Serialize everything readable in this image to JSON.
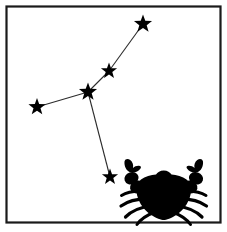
{
  "frame": {
    "name": "border-frame",
    "x": 6.5,
    "y": 6.5,
    "width": 214,
    "height": 216,
    "stroke_color": "#1a1a1a",
    "fill_color": "#ffffff"
  },
  "canvas": {
    "width": 227,
    "height": 232,
    "background": "#ffffff"
  },
  "constellation": {
    "name": "Cancer",
    "star_color": "#000000",
    "line_color": "#2b2b2b",
    "stars": [
      {
        "id": "star-top",
        "label": "Iota Cancri",
        "x": 143,
        "y": 24,
        "r": 9.5
      },
      {
        "id": "star-upper-mid",
        "label": "Delta Cancri",
        "x": 109,
        "y": 71,
        "r": 8.5
      },
      {
        "id": "star-junction",
        "label": "Beta Cancri",
        "x": 88,
        "y": 92,
        "r": 9.5
      },
      {
        "id": "star-left",
        "label": "Alpha Cancri",
        "x": 37,
        "y": 107,
        "r": 9.0
      },
      {
        "id": "star-bottom",
        "label": "Gamma Cancri",
        "x": 110,
        "y": 177,
        "r": 8.5
      }
    ],
    "segments": [
      {
        "id": "segment-top",
        "from": "star-top",
        "to": "star-upper-mid"
      },
      {
        "id": "segment-upper",
        "from": "star-upper-mid",
        "to": "star-junction"
      },
      {
        "id": "segment-left",
        "from": "star-junction",
        "to": "star-left"
      },
      {
        "id": "segment-down",
        "from": "star-junction",
        "to": "star-bottom"
      }
    ]
  },
  "crab": {
    "name": "crab-symbol",
    "color": "#000000",
    "shell_label": "crab-shell",
    "left_claw_label": "crab-left-claw",
    "right_claw_label": "crab-right-claw",
    "left_legs_label": "crab-left-legs",
    "right_legs_label": "crab-right-legs",
    "leg_count_per_side": 4
  }
}
